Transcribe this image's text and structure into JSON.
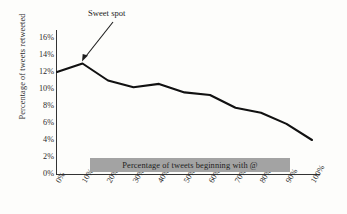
{
  "chart_data": {
    "type": "line",
    "title": "",
    "xlabel": "Percentage of tweets beginning with @",
    "ylabel": "Percentage of tweets retweeted",
    "categories": [
      "0%",
      "10%",
      "20%",
      "30%",
      "40%",
      "50%",
      "60%",
      "70%",
      "80%",
      "90%",
      "100%"
    ],
    "x": [
      0,
      10,
      20,
      30,
      40,
      50,
      60,
      70,
      80,
      90,
      100
    ],
    "values": [
      12.0,
      13.0,
      11.0,
      10.2,
      10.6,
      9.6,
      9.3,
      7.8,
      7.2,
      5.9,
      4.0
    ],
    "ylim": [
      0,
      16
    ],
    "xlim": [
      0,
      100
    ],
    "yticks": [
      "0%",
      "2%",
      "4%",
      "6%",
      "8%",
      "10%",
      "12%",
      "14%",
      "16%"
    ],
    "ytick_values": [
      0,
      2,
      4,
      6,
      8,
      10,
      12,
      14,
      16
    ],
    "xticks": [
      "0%",
      "10%",
      "20%",
      "30%",
      "40%",
      "50%",
      "60%",
      "70%",
      "80%",
      "90%",
      "100%"
    ],
    "grid": false,
    "legend": false,
    "series": [
      {
        "name": "Percentage of tweets retweeted",
        "values": [
          12.0,
          13.0,
          11.0,
          10.2,
          10.6,
          9.6,
          9.3,
          7.8,
          7.2,
          5.9,
          4.0
        ],
        "color": "#111111"
      }
    ],
    "annotations": [
      {
        "text": "Sweet spot",
        "points_to_x": 10,
        "points_to_y": 13.0
      }
    ],
    "line_color": "#111111",
    "axis_color": "#333333",
    "band_color": "#a3a3a3",
    "background_color": "#fdfdfb"
  }
}
